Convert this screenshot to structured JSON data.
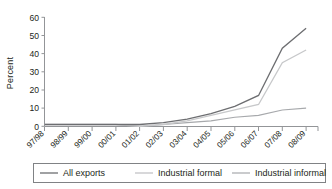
{
  "chart_data": {
    "type": "line",
    "title": "",
    "xlabel": "",
    "ylabel": "Percent",
    "ylim": [
      0,
      60
    ],
    "ytick_step": 10,
    "yticks": [
      "0",
      "10",
      "20",
      "30",
      "40",
      "50",
      "60"
    ],
    "grid": false,
    "legend_position": "bottom",
    "categories": [
      "97/98",
      "98/99",
      "99/00",
      "00/01",
      "01/02",
      "02/03",
      "03/04",
      "04/05",
      "05/06",
      "06/07",
      "07/08",
      "08/09"
    ],
    "series": [
      {
        "name": "All exports",
        "color": "#6d6e71",
        "values": [
          1,
          1,
          1,
          1,
          1,
          2,
          4,
          7,
          11,
          17,
          43,
          54
        ]
      },
      {
        "name": "Industrial formal",
        "color": "#c7c8ca",
        "values": [
          1,
          1,
          1,
          1,
          0,
          1,
          3,
          6,
          9,
          12,
          35,
          42
        ]
      },
      {
        "name": "Industrial informal",
        "color": "#a7a9ac",
        "values": [
          1,
          1,
          1,
          1,
          0,
          1,
          2,
          3,
          5,
          6,
          9,
          10
        ]
      }
    ]
  },
  "axes": {
    "y_axis_label": "Percent",
    "y_tick_labels": [
      "60",
      "50",
      "40",
      "30",
      "20",
      "10",
      "0"
    ],
    "x_tick_labels": [
      "97/98",
      "98/99",
      "99/00",
      "00/01",
      "01/02",
      "02/03",
      "03/04",
      "04/05",
      "05/06",
      "06/07",
      "07/08",
      "08/09"
    ]
  },
  "legend": {
    "items": [
      {
        "label": "All exports",
        "color": "#6d6e71"
      },
      {
        "label": "Industrial formal",
        "color": "#c7c8ca"
      },
      {
        "label": "Industrial informal",
        "color": "#a7a9ac"
      }
    ]
  },
  "style": {
    "axis_color": "#939598",
    "text_color": "#231f20",
    "legend_border": "#808285",
    "background": "#ffffff"
  }
}
